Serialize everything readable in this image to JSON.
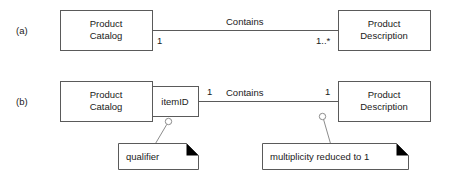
{
  "diagram": {
    "type": "uml-class-diagram",
    "colors": {
      "background": "#ffffff",
      "box_stroke": "#5a5a5a",
      "line_stroke": "#5a5a5a",
      "leader_stroke": "#8c8c8c",
      "note_fold": "#000000",
      "text": "#1a1a1a"
    },
    "rows": [
      {
        "tag": "(a)",
        "left_class": "Product\nCatalog",
        "left_class_line1": "Product",
        "left_class_line2": "Catalog",
        "right_class_line1": "Product",
        "right_class_line2": "Description",
        "association_name": "Contains",
        "left_multiplicity": "1",
        "right_multiplicity": "1..*",
        "qualifier": null
      },
      {
        "tag": "(b)",
        "left_class_line1": "Product",
        "left_class_line2": "Catalog",
        "right_class_line1": "Product",
        "right_class_line2": "Description",
        "association_name": "Contains",
        "left_multiplicity": "1",
        "right_multiplicity": "1",
        "qualifier": "itemID"
      }
    ],
    "notes": [
      {
        "text": "qualifier"
      },
      {
        "text": "multiplicity reduced to 1"
      }
    ]
  }
}
